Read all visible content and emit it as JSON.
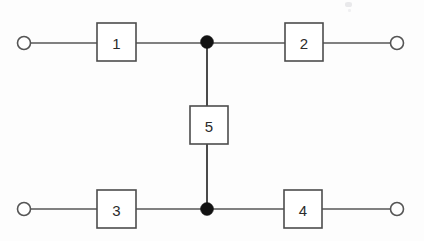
{
  "diagram": {
    "type": "reliability-block-diagram",
    "title": "",
    "background_color": "#fdfdfd",
    "line_color": "#565656",
    "block_fill": "#ffffff",
    "block_stroke": "#4d4d4d",
    "node_color": "#121212",
    "terminal_stroke": "#555555",
    "blocks": [
      {
        "id": "block-1",
        "label": "1",
        "x": 97,
        "y": 23,
        "width": 39,
        "height": 38
      },
      {
        "id": "block-2",
        "label": "2",
        "x": 285,
        "y": 23,
        "width": 38,
        "height": 38
      },
      {
        "id": "block-5",
        "label": "5",
        "x": 190,
        "y": 106,
        "width": 38,
        "height": 38
      },
      {
        "id": "block-3",
        "label": "3",
        "x": 97,
        "y": 190,
        "width": 39,
        "height": 38
      },
      {
        "id": "block-4",
        "label": "4",
        "x": 284,
        "y": 190,
        "width": 38,
        "height": 38
      }
    ],
    "terminals": [
      {
        "id": "terminal-top-left",
        "cx": 24,
        "cy": 43,
        "r": 6.5
      },
      {
        "id": "terminal-top-right",
        "cx": 397,
        "cy": 43,
        "r": 6.5
      },
      {
        "id": "terminal-bottom-left",
        "cx": 24,
        "cy": 209,
        "r": 6.5
      },
      {
        "id": "terminal-bottom-right",
        "cx": 397,
        "cy": 209,
        "r": 6.5
      }
    ],
    "nodes": [
      {
        "id": "junction-top",
        "cx": 207,
        "cy": 42,
        "r": 6.5
      },
      {
        "id": "junction-bottom",
        "cx": 207,
        "cy": 209,
        "r": 6.5
      }
    ],
    "edges": [
      {
        "id": "edge-top-left-lead",
        "x1": 31,
        "y1": 43,
        "x2": 97,
        "y2": 43
      },
      {
        "id": "edge-block1-junction",
        "x1": 136,
        "y1": 43,
        "x2": 201,
        "y2": 43
      },
      {
        "id": "edge-junction-block2",
        "x1": 213,
        "y1": 43,
        "x2": 285,
        "y2": 43
      },
      {
        "id": "edge-block2-right",
        "x1": 323,
        "y1": 43,
        "x2": 391,
        "y2": 43
      },
      {
        "id": "edge-bottom-left-lead",
        "x1": 31,
        "y1": 209,
        "x2": 97,
        "y2": 209
      },
      {
        "id": "edge-block3-junction",
        "x1": 136,
        "y1": 209,
        "x2": 201,
        "y2": 209
      },
      {
        "id": "edge-junction-block4",
        "x1": 213,
        "y1": 209,
        "x2": 284,
        "y2": 209
      },
      {
        "id": "edge-block4-right",
        "x1": 322,
        "y1": 209,
        "x2": 391,
        "y2": 209
      },
      {
        "id": "edge-junction-top-block5",
        "x1": 207,
        "y1": 46,
        "x2": 207,
        "y2": 106
      },
      {
        "id": "edge-block5-junction-bottom",
        "x1": 207,
        "y1": 144,
        "x2": 207,
        "y2": 206
      }
    ]
  }
}
